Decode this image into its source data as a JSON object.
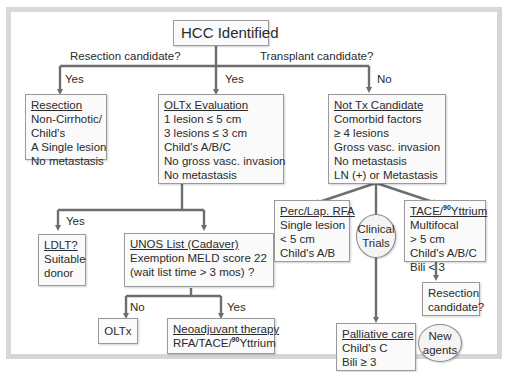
{
  "diagram": {
    "title": "HCC Identified",
    "branch_labels": {
      "resection_question": "Resection candidate?",
      "transplant_question": "Transplant candidate?",
      "resection_yes": "Yes",
      "transplant_yes": "Yes",
      "transplant_no": "No",
      "ldlt_yes": "Yes",
      "unos_no": "No",
      "unos_yes": "Yes"
    },
    "nodes": {
      "resection": {
        "title": "Resection",
        "lines": [
          "Non-Cirrhotic/",
          "Child's",
          "A Single lesion",
          "No metastasis"
        ]
      },
      "oltx_evaluation": {
        "title": "OLTx Evaluation",
        "lines": [
          "1 lesion ≤ 5 cm",
          "3 lesions ≤ 3 cm",
          "Child's A/B/C",
          "No gross vasc. invasion",
          "No metastasis"
        ]
      },
      "not_tx_candidate": {
        "title": "Not Tx Candidate",
        "lines": [
          "Comorbid factors",
          "≥ 4 lesions",
          "Gross vasc. invasion",
          "No metastasis",
          "LN (+) or Metastasis"
        ]
      },
      "ldlt": {
        "title": "LDLT?",
        "lines": [
          "Suitable",
          "donor"
        ]
      },
      "unos_list": {
        "title": "UNOS List (Cadaver)",
        "lines": [
          "Exemption MELD score 22",
          "(wait list time > 3 mos) ?"
        ]
      },
      "oltx": {
        "label": "OLTx"
      },
      "neoadjuvant": {
        "title": "Neoadjuvant therapy",
        "line_prefix": "RFA/TACE/",
        "line_sup": "90",
        "line_suffix": "Yttrium"
      },
      "perc_rfa": {
        "title": "Perc/Lap. RFA",
        "lines": [
          "Single lesion",
          "< 5 cm",
          "Child's A/B"
        ]
      },
      "clinical_trials": {
        "lines": [
          "Clinical",
          "Trials"
        ]
      },
      "tace_yttrium": {
        "title_prefix": "TACE/",
        "title_sup": "90",
        "title_suffix": "Yttrium",
        "lines": [
          "Multifocal",
          "> 5 cm",
          "Child's A/B/C",
          "Bili < 3"
        ]
      },
      "resection_candidate": {
        "lines": [
          "Resection",
          "candidate?"
        ]
      },
      "palliative_care": {
        "title": "Palliative care",
        "lines": [
          "Child's C",
          "Bili ≥ 3"
        ]
      },
      "new_agents": {
        "lines": [
          "New",
          "agents"
        ]
      }
    },
    "colors": {
      "connector": "#6e6e6e",
      "box_border": "#9a9a9a",
      "box_fill": "#fafafa",
      "frame": "#d9d9d9"
    }
  }
}
